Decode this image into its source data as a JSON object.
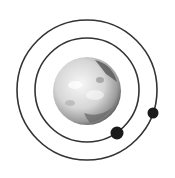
{
  "diagram": {
    "title": "",
    "type": "orbital-diagram",
    "colors": {
      "background": "#ffffff",
      "orbit": "#333333",
      "moon": "#1a1a1a",
      "planet_light": "#f2f2f2",
      "planet_mid": "#bdbdbd",
      "planet_dark": "#4a4a4a"
    },
    "planet": {
      "label": "",
      "cx": 87,
      "cy": 91,
      "r": 34
    },
    "orbits": [
      {
        "name": "inner-orbit",
        "cx": 87,
        "cy": 90,
        "r": 52
      },
      {
        "name": "outer-orbit",
        "cx": 87,
        "cy": 90,
        "r": 70
      }
    ],
    "moons": [
      {
        "name": "inner-moon",
        "cx": 117,
        "cy": 133,
        "r": 6.5
      },
      {
        "name": "outer-moon",
        "cx": 153,
        "cy": 113,
        "r": 5.5
      }
    ]
  }
}
